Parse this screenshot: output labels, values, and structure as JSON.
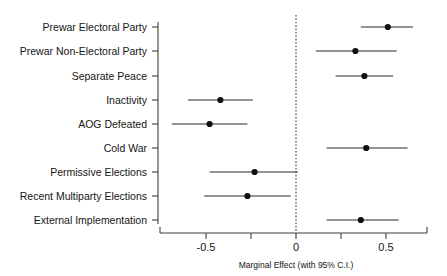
{
  "chart_data": {
    "type": "scatter",
    "title": "",
    "xlabel": "Marginal Effect (with 95% C.I.)",
    "ylabel": "",
    "xlim": [
      -0.62,
      0.73
    ],
    "xticks": [
      -0.5,
      -0.25,
      0,
      0.25,
      0.5
    ],
    "xticklabels": [
      "-0.5",
      "",
      "0",
      "",
      "0.5"
    ],
    "grid": false,
    "legend": "none",
    "reference_line": 0,
    "categories": [
      "Prewar Electoral Party",
      "Prewar Non-Electoral Party",
      "Separate Peace",
      "Inactivity",
      "AOG Defeated",
      "Cold War",
      "Permissive Elections",
      "Recent Multiparty Elections",
      "External Implementation"
    ],
    "values": [
      0.51,
      0.33,
      0.38,
      -0.42,
      -0.48,
      0.39,
      -0.23,
      -0.27,
      0.36
    ],
    "ci_low": [
      0.36,
      0.11,
      0.22,
      -0.6,
      -0.69,
      0.17,
      -0.48,
      -0.51,
      0.17
    ],
    "ci_high": [
      0.65,
      0.56,
      0.54,
      -0.24,
      -0.27,
      0.62,
      0.01,
      -0.03,
      0.57
    ]
  },
  "labels": {
    "row0": "Prewar Electoral Party",
    "row1": "Prewar Non-Electoral Party",
    "row2": "Separate Peace",
    "row3": "Inactivity",
    "row4": "AOG Defeated",
    "row5": "Cold War",
    "row6": "Permissive Elections",
    "row7": "Recent Multiparty Elections",
    "row8": "External Implementation"
  },
  "xaxis": {
    "tick0": "-0.5",
    "tick1": "0",
    "tick2": "0.5",
    "title": "Marginal Effect (with 95% C.I.)"
  },
  "colors": {
    "point": "#101010",
    "line": "#2b2b2b",
    "axis": "#3d3d3d",
    "background": "#ffffff"
  }
}
